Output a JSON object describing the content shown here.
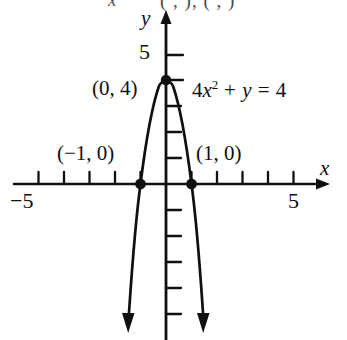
{
  "figure": {
    "caption_fragment_left": "x",
    "caption_fragment": "(   ,   ), (   ,   )",
    "axis": {
      "x_label": "x",
      "y_label": "y",
      "x_tick_min_label": "−5",
      "x_tick_max_label": "5",
      "y_tick_label": "5"
    },
    "annotations": {
      "vertex_point": "(0, 4)",
      "left_intercept": "(−1, 0)",
      "right_intercept": "(1, 0)",
      "equation_coef": "4",
      "equation_var": "x",
      "equation_exp": "2",
      "equation_rest": "+ y = 4"
    },
    "colors": {
      "ink": "#101010",
      "background": "#ffffff"
    }
  },
  "chart_data": {
    "type": "line",
    "title": "",
    "subtitle": "",
    "equation": "4x^2 + y = 4",
    "function": "y = 4 - 4x^2",
    "xlabel": "x",
    "ylabel": "y",
    "xlim": [
      -5,
      5
    ],
    "ylim": [
      -6.5,
      5.5
    ],
    "xticks": [
      -5,
      -4,
      -3,
      -2,
      -1,
      1,
      2,
      3,
      4,
      5
    ],
    "yticks": [
      1,
      2,
      3,
      4,
      5
    ],
    "xtick_labels": {
      "-5": "−5",
      "5": "5"
    },
    "ytick_labels": {
      "5": "5"
    },
    "grid": false,
    "legend": false,
    "series": [
      {
        "name": "4x² + y = 4",
        "type": "parabola",
        "orientation": "opens-down",
        "vertex": [
          0,
          4
        ],
        "a": -4,
        "x": [
          -1.6,
          -1.4,
          -1.2,
          -1.0,
          -0.8,
          -0.6,
          -0.4,
          -0.2,
          0,
          0.2,
          0.4,
          0.6,
          0.8,
          1.0,
          1.2,
          1.4,
          1.6
        ],
        "y": [
          -6.24,
          -3.84,
          -1.76,
          0,
          1.44,
          2.56,
          3.36,
          3.84,
          4,
          3.84,
          3.36,
          2.56,
          1.44,
          0,
          -1.76,
          -3.84,
          -6.24
        ],
        "arrows": [
          "start",
          "end"
        ]
      }
    ],
    "points": [
      {
        "label": "(0, 4)",
        "x": 0,
        "y": 4,
        "marker": "filled-circle"
      },
      {
        "label": "(−1, 0)",
        "x": -1,
        "y": 0,
        "marker": "filled-circle"
      },
      {
        "label": "(1, 0)",
        "x": 1,
        "y": 0,
        "marker": "filled-circle"
      }
    ],
    "annotations": [
      {
        "text": "4x² + y = 4",
        "x": 1.05,
        "y": 3.6
      }
    ]
  }
}
